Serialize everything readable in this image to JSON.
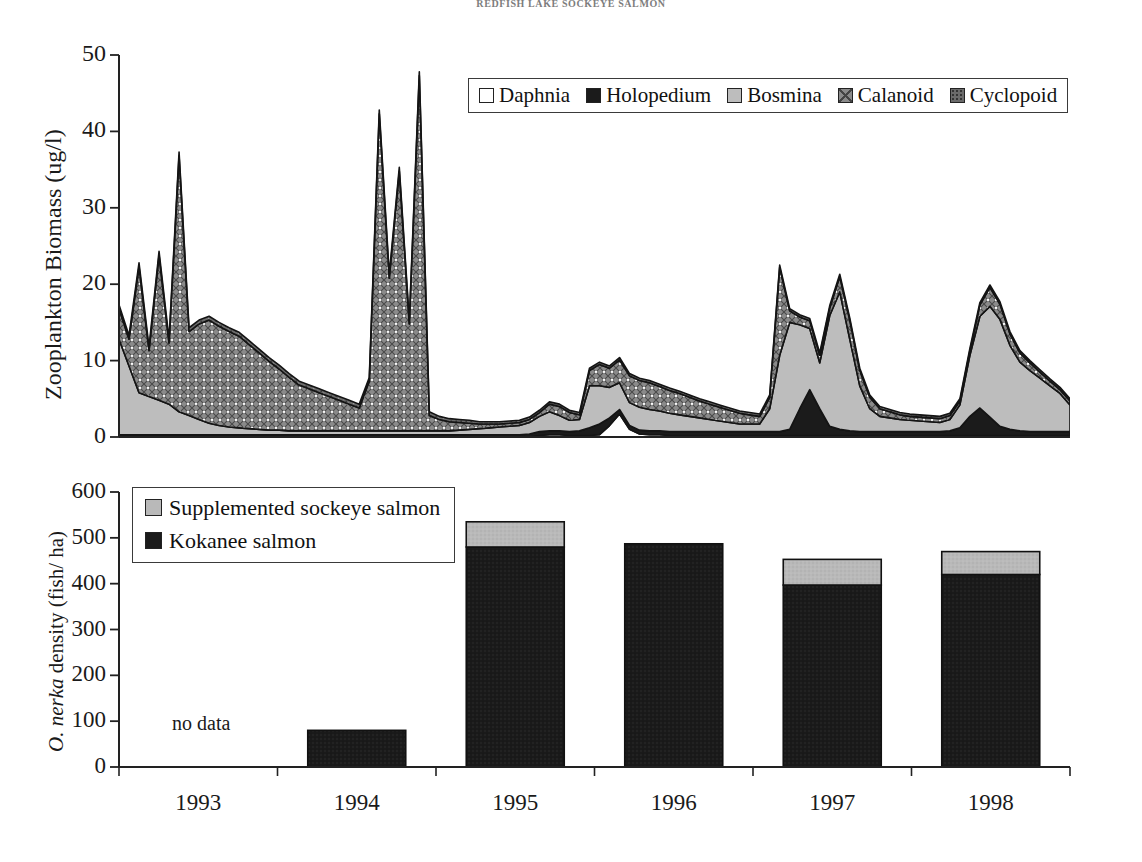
{
  "page": {
    "running_head": "REDFISH LAKE SOCKEYE SALMON"
  },
  "top_panel": {
    "ylabel": "Zooplankton Biomass (ug/l)",
    "yticks": [
      "0",
      "10",
      "20",
      "30",
      "40",
      "50"
    ],
    "legend": [
      {
        "label": "Daphnia",
        "swatch": "daphnia-swatch",
        "color": "#ffffff"
      },
      {
        "label": "Holopedium",
        "swatch": "holopedium-swatch",
        "color": "#1b1b1b"
      },
      {
        "label": "Bosmina",
        "swatch": "bosmina-swatch",
        "color": "#bdbdbd"
      },
      {
        "label": "Calanoid",
        "swatch": "calanoid-swatch",
        "color": "#8f8f8f"
      },
      {
        "label": "Cyclopoid",
        "swatch": "cyclopoid-swatch",
        "color": "#6f6f6f"
      }
    ]
  },
  "bottom_panel": {
    "ylabel_italic": "O. nerka",
    "ylabel_rest": " density (fish/ ha)",
    "yticks": [
      "0",
      "100",
      "200",
      "300",
      "400",
      "500",
      "600"
    ],
    "xticks": [
      "1993",
      "1994",
      "1995",
      "1996",
      "1997",
      "1998"
    ],
    "no_data_label": "no data",
    "legend": [
      {
        "label": "Supplemented sockeye salmon",
        "swatch": "supplemented-sockeye-swatch",
        "color": "#b9b9b9"
      },
      {
        "label": "Kokanee salmon",
        "swatch": "kokanee-swatch",
        "color": "#1b1b1b"
      }
    ]
  },
  "chart_data": [
    {
      "type": "area",
      "id": "zooplankton-biomass-stacked-area",
      "title": "",
      "xlabel": "",
      "ylabel": "Zooplankton Biomass (ug/l)",
      "ylim": [
        0,
        50
      ],
      "yticks": [
        0,
        10,
        20,
        30,
        40,
        50
      ],
      "grid": false,
      "stacked": true,
      "legend_position": "top-right",
      "x_span_years": [
        "1993",
        "1994",
        "1995",
        "1996",
        "1997",
        "1998"
      ],
      "x": [
        0,
        1,
        2,
        3,
        4,
        5,
        6,
        7,
        8,
        9,
        10,
        11,
        12,
        13,
        14,
        15,
        16,
        17,
        18,
        19,
        20,
        21,
        22,
        23,
        24,
        25,
        26,
        27,
        28,
        29,
        30,
        31,
        32,
        33,
        34,
        35,
        36,
        37,
        38,
        39,
        40,
        41,
        42,
        43,
        44,
        45,
        46,
        47,
        48,
        49,
        50,
        51,
        52,
        53,
        54,
        55,
        56,
        57,
        58,
        59,
        60,
        61,
        62,
        63,
        64,
        65,
        66,
        67,
        68,
        69,
        70,
        71,
        72,
        73,
        74,
        75,
        76,
        77,
        78,
        79,
        80,
        81,
        82,
        83,
        84,
        85,
        86,
        87,
        88,
        89,
        90,
        91,
        92,
        93,
        94,
        95
      ],
      "series": [
        {
          "name": "Daphnia",
          "color": "#ffffff",
          "values": [
            0,
            0,
            0,
            0,
            0,
            0,
            0,
            0,
            0,
            0,
            0,
            0,
            0,
            0,
            0,
            0,
            0,
            0,
            0,
            0,
            0,
            0,
            0,
            0,
            0,
            0,
            0,
            0,
            0,
            0,
            0,
            0,
            0,
            0,
            0,
            0,
            0,
            0,
            0,
            0,
            0,
            0,
            0.2,
            0.3,
            0.3,
            0.2,
            0.2,
            0.2,
            0.3,
            1.5,
            3.0,
            1.0,
            0.4,
            0.3,
            0.3,
            0.2,
            0.2,
            0.2,
            0.2,
            0.2,
            0.2,
            0.2,
            0.2,
            0.2,
            0.2,
            0.2,
            0.2,
            0.2,
            0.2,
            0.2,
            0.2,
            0.2,
            0.2,
            0.2,
            0.2,
            0.2,
            0.2,
            0.2,
            0.2,
            0.2,
            0.2,
            0.2,
            0.2,
            0.2,
            0.2,
            0.2,
            0.2,
            0.2,
            0.2,
            0.2,
            0.2,
            0.2,
            0.2,
            0.2,
            0.2,
            0.2
          ]
        },
        {
          "name": "Holopedium",
          "color": "#1b1b1b",
          "values": [
            0.3,
            0.3,
            0.3,
            0.3,
            0.3,
            0.3,
            0.3,
            0.3,
            0.3,
            0.3,
            0.3,
            0.3,
            0.3,
            0.3,
            0.3,
            0.3,
            0.3,
            0.3,
            0.3,
            0.3,
            0.3,
            0.3,
            0.3,
            0.3,
            0.3,
            0.3,
            0.3,
            0.3,
            0.3,
            0.3,
            0.3,
            0.3,
            0.3,
            0.3,
            0.3,
            0.3,
            0.3,
            0.3,
            0.3,
            0.3,
            0.3,
            0.4,
            0.5,
            0.5,
            0.5,
            0.5,
            0.6,
            1.0,
            1.4,
            1.0,
            0.6,
            0.5,
            0.5,
            0.5,
            0.5,
            0.5,
            0.5,
            0.5,
            0.5,
            0.5,
            0.5,
            0.5,
            0.5,
            0.5,
            0.5,
            0.5,
            0.5,
            0.8,
            3.5,
            6.0,
            3.5,
            1.2,
            0.8,
            0.6,
            0.5,
            0.5,
            0.5,
            0.5,
            0.5,
            0.5,
            0.5,
            0.5,
            0.5,
            0.6,
            1.0,
            2.5,
            3.6,
            2.4,
            1.2,
            0.8,
            0.6,
            0.5,
            0.5,
            0.5,
            0.5,
            0.5
          ]
        },
        {
          "name": "Bosmina",
          "color": "#bdbdbd",
          "values": [
            12.5,
            9.0,
            5.5,
            5.0,
            4.5,
            4.0,
            3.0,
            2.5,
            2.0,
            1.5,
            1.2,
            1.0,
            0.9,
            0.8,
            0.7,
            0.6,
            0.6,
            0.5,
            0.5,
            0.5,
            0.5,
            0.5,
            0.5,
            0.5,
            0.5,
            0.5,
            0.5,
            0.5,
            0.5,
            0.5,
            0.5,
            0.5,
            0.5,
            0.5,
            0.6,
            0.7,
            0.8,
            0.9,
            1.0,
            1.1,
            1.2,
            1.5,
            2.0,
            2.5,
            2.0,
            1.5,
            1.5,
            5.5,
            5.0,
            4.0,
            3.5,
            3.0,
            3.0,
            2.8,
            2.6,
            2.4,
            2.2,
            2.0,
            1.8,
            1.6,
            1.4,
            1.2,
            1.0,
            1.0,
            1.0,
            3.0,
            10.0,
            14.0,
            11.0,
            8.0,
            6.0,
            14.5,
            18.0,
            12.0,
            6.0,
            3.0,
            2.0,
            1.8,
            1.6,
            1.5,
            1.4,
            1.3,
            1.2,
            1.5,
            3.0,
            8.0,
            12.0,
            14.5,
            14.0,
            11.0,
            9.0,
            8.0,
            7.0,
            6.0,
            5.0,
            3.5
          ]
        },
        {
          "name": "Calanoid",
          "color": "#8f8f8f",
          "values": [
            4.0,
            3.5,
            16.5,
            6.0,
            19.0,
            8.0,
            33.5,
            11.0,
            12.5,
            13.5,
            13.0,
            12.5,
            12.0,
            11.0,
            10.0,
            9.0,
            8.0,
            7.0,
            6.0,
            5.5,
            5.0,
            4.5,
            4.0,
            3.5,
            3.0,
            6.5,
            41.5,
            20.0,
            34.0,
            14.0,
            46.5,
            2.0,
            1.5,
            1.2,
            1.0,
            0.8,
            0.6,
            0.5,
            0.4,
            0.4,
            0.4,
            0.4,
            0.5,
            1.0,
            1.2,
            1.0,
            0.6,
            2.0,
            2.8,
            2.5,
            3.0,
            3.5,
            3.5,
            3.5,
            3.2,
            3.0,
            2.8,
            2.5,
            2.2,
            2.0,
            1.8,
            1.6,
            1.4,
            1.2,
            1.0,
            1.5,
            11.5,
            1.5,
            1.0,
            1.0,
            1.0,
            1.0,
            2.0,
            2.5,
            2.0,
            1.5,
            1.0,
            0.8,
            0.6,
            0.5,
            0.5,
            0.5,
            0.5,
            0.5,
            0.5,
            0.6,
            1.5,
            2.5,
            2.0,
            1.5,
            1.2,
            1.0,
            0.8,
            0.6,
            0.5,
            0.5
          ]
        },
        {
          "name": "Cyclopoid",
          "color": "#6f6f6f",
          "values": [
            0.5,
            0.5,
            0.5,
            0.5,
            0.5,
            0.5,
            0.5,
            0.5,
            0.5,
            0.5,
            0.5,
            0.5,
            0.5,
            0.5,
            0.5,
            0.5,
            0.5,
            0.5,
            0.5,
            0.5,
            0.5,
            0.5,
            0.5,
            0.5,
            0.5,
            0.5,
            0.5,
            0.5,
            0.5,
            0.5,
            0.5,
            0.5,
            0.4,
            0.4,
            0.4,
            0.4,
            0.3,
            0.3,
            0.3,
            0.3,
            0.3,
            0.3,
            0.3,
            0.3,
            0.3,
            0.3,
            0.3,
            0.3,
            0.3,
            0.3,
            0.3,
            0.3,
            0.3,
            0.3,
            0.3,
            0.3,
            0.3,
            0.3,
            0.3,
            0.3,
            0.3,
            0.3,
            0.3,
            0.3,
            0.3,
            0.3,
            0.3,
            0.3,
            0.3,
            0.3,
            0.3,
            0.3,
            0.3,
            0.3,
            0.3,
            0.3,
            0.3,
            0.3,
            0.3,
            0.3,
            0.3,
            0.3,
            0.3,
            0.3,
            0.3,
            0.3,
            0.3,
            0.3,
            0.3,
            0.3,
            0.3,
            0.3,
            0.3,
            0.3,
            0.3,
            0.3
          ]
        }
      ],
      "peaks_ug_per_l": [
        27,
        28,
        39,
        44,
        36,
        49,
        8.5,
        7,
        23,
        25.5,
        22,
        19.5
      ]
    },
    {
      "type": "bar",
      "id": "onerka-density-stacked-bar",
      "title": "",
      "xlabel": "",
      "ylabel": "O. nerka density (fish/ ha)",
      "categories": [
        "1993",
        "1994",
        "1995",
        "1996",
        "1997",
        "1998"
      ],
      "ylim": [
        0,
        600
      ],
      "yticks": [
        0,
        100,
        200,
        300,
        400,
        500,
        600
      ],
      "stacked": true,
      "grid": false,
      "legend_position": "top-left",
      "annotations": [
        {
          "text": "no data",
          "category": "1993"
        }
      ],
      "series": [
        {
          "name": "Kokanee salmon",
          "color": "#1b1b1b",
          "values": [
            null,
            80,
            480,
            487,
            397,
            420
          ]
        },
        {
          "name": "Supplemented sockeye salmon",
          "color": "#b9b9b9",
          "values": [
            null,
            0,
            55,
            0,
            56,
            50
          ]
        }
      ],
      "totals": [
        null,
        80,
        535,
        487,
        453,
        470
      ]
    }
  ]
}
